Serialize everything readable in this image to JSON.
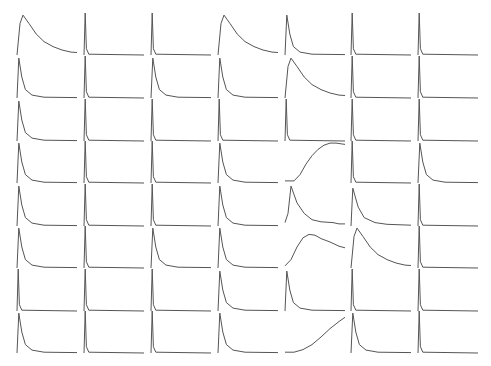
{
  "chart_data": {
    "type": "line",
    "layout": "small-multiples",
    "rows": 8,
    "cols": 7,
    "title": "",
    "xlabel": "",
    "ylabel": "",
    "grid": false,
    "axes_visible": false,
    "line_color": "#555555",
    "background": "#ffffff",
    "panel": {
      "col_x": [
        17,
        84,
        151,
        218,
        285,
        351,
        418
      ],
      "row_baseline_y": [
        55,
        98,
        141,
        183,
        226,
        268,
        311,
        353
      ],
      "width": 60,
      "height": 42
    },
    "panels": [
      [
        "slow_decay",
        "spike",
        "spike",
        "slow_decay",
        "fast_decay",
        "spike",
        "spike"
      ],
      [
        "fast_decay",
        "spike",
        "fast_decay",
        "fast_decay",
        "slow_decay",
        "spike",
        "spike"
      ],
      [
        "fast_decay",
        "spike",
        "spike",
        "spike",
        "spike",
        "spike",
        "spike"
      ],
      [
        "fast_decay",
        "spike",
        "spike",
        "fast_decay",
        "rise_plateau",
        "spike",
        "fast_decay"
      ],
      [
        "fast_decay",
        "spike",
        "spike",
        "fast_decay",
        "peak_decay",
        "medium_decay",
        "spike"
      ],
      [
        "fast_decay",
        "spike",
        "fast_decay",
        "fast_decay",
        "rise_peak",
        "slow_decay",
        "spike"
      ],
      [
        "spike",
        "spike",
        "spike",
        "fast_decay",
        "fast_decay",
        "spike",
        "spike"
      ],
      [
        "fast_decay",
        "spike",
        "spike",
        "fast_decay",
        "rise_linear",
        "fast_decay",
        "spike"
      ]
    ],
    "shapes": {
      "spike": [
        [
          0,
          0
        ],
        [
          0.02,
          1
        ],
        [
          0.04,
          0.15
        ],
        [
          0.08,
          0.02
        ],
        [
          1,
          0
        ]
      ],
      "fast_decay": [
        [
          0,
          0
        ],
        [
          0.03,
          0.95
        ],
        [
          0.08,
          0.5
        ],
        [
          0.14,
          0.2
        ],
        [
          0.25,
          0.07
        ],
        [
          0.45,
          0.02
        ],
        [
          1,
          0.01
        ]
      ],
      "medium_decay": [
        [
          0,
          0
        ],
        [
          0.03,
          0.9
        ],
        [
          0.12,
          0.45
        ],
        [
          0.22,
          0.2
        ],
        [
          0.4,
          0.08
        ],
        [
          0.6,
          0.04
        ],
        [
          1,
          0.02
        ]
      ],
      "slow_decay": [
        [
          0,
          0
        ],
        [
          0.05,
          0.75
        ],
        [
          0.1,
          0.95
        ],
        [
          0.2,
          0.75
        ],
        [
          0.32,
          0.5
        ],
        [
          0.45,
          0.32
        ],
        [
          0.6,
          0.2
        ],
        [
          0.75,
          0.12
        ],
        [
          0.9,
          0.07
        ],
        [
          1,
          0.06
        ]
      ],
      "peak_decay": [
        [
          0,
          0.08
        ],
        [
          0.05,
          0.3
        ],
        [
          0.1,
          0.95
        ],
        [
          0.2,
          0.55
        ],
        [
          0.32,
          0.3
        ],
        [
          0.45,
          0.15
        ],
        [
          0.6,
          0.1
        ],
        [
          0.8,
          0.08
        ],
        [
          0.9,
          0.05
        ],
        [
          1,
          0.05
        ]
      ],
      "rise_plateau": [
        [
          0,
          0.05
        ],
        [
          0.15,
          0.05
        ],
        [
          0.25,
          0.2
        ],
        [
          0.35,
          0.45
        ],
        [
          0.45,
          0.65
        ],
        [
          0.55,
          0.8
        ],
        [
          0.65,
          0.9
        ],
        [
          0.75,
          0.95
        ],
        [
          0.85,
          0.95
        ],
        [
          1,
          0.92
        ]
      ],
      "rise_peak": [
        [
          0,
          0.05
        ],
        [
          0.1,
          0.2
        ],
        [
          0.2,
          0.5
        ],
        [
          0.3,
          0.72
        ],
        [
          0.4,
          0.8
        ],
        [
          0.5,
          0.78
        ],
        [
          0.6,
          0.7
        ],
        [
          0.75,
          0.62
        ],
        [
          0.9,
          0.52
        ],
        [
          1,
          0.48
        ]
      ],
      "rise_linear": [
        [
          0,
          0.02
        ],
        [
          0.15,
          0.02
        ],
        [
          0.3,
          0.08
        ],
        [
          0.45,
          0.2
        ],
        [
          0.6,
          0.38
        ],
        [
          0.75,
          0.58
        ],
        [
          0.9,
          0.75
        ],
        [
          1,
          0.85
        ]
      ]
    }
  }
}
